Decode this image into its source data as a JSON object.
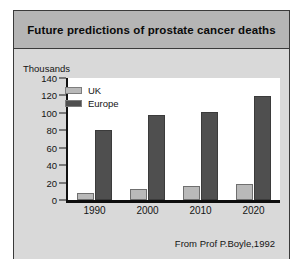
{
  "figure": {
    "title": "Future predictions of prostate cancer deaths",
    "attribution": "From Prof P.Boyle,1992",
    "colors": {
      "frame_border": "#3a3a3a",
      "title_bar": "#b5b5b5",
      "body_background": "#d9d9d9",
      "panel_background": "#ffffff",
      "uk_series": "#b9b9b9",
      "europe_series": "#4f4f4f",
      "axis": "#0d0d0d",
      "text": "#141414"
    }
  },
  "chart_data": {
    "type": "bar",
    "title": "Future predictions of prostate cancer deaths",
    "xlabel": "",
    "ylabel": "Thousands",
    "categories": [
      "1990",
      "2000",
      "2010",
      "2020"
    ],
    "series": [
      {
        "name": "UK",
        "values": [
          8,
          13,
          16,
          18
        ],
        "color": "#b9b9b9"
      },
      {
        "name": "Europe",
        "values": [
          80,
          97,
          101,
          119
        ],
        "color": "#4f4f4f"
      }
    ],
    "ylim": [
      0,
      140
    ],
    "ytick_labels": [
      "140",
      "120",
      "100",
      "80",
      "60",
      "40",
      "20",
      "0"
    ],
    "ytick_values": [
      140,
      120,
      100,
      80,
      60,
      40,
      20,
      0
    ],
    "grid": false,
    "legend_position": "inside-top-left",
    "annotations": [
      "From Prof P.Boyle,1992"
    ]
  }
}
